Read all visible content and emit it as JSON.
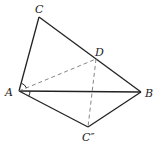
{
  "diagram": {
    "type": "geometry",
    "points": {
      "A": {
        "x": 19,
        "y": 91
      },
      "B": {
        "x": 141,
        "y": 92
      },
      "C": {
        "x": 39,
        "y": 17
      },
      "D": {
        "x": 96,
        "y": 59
      },
      "C2": {
        "x": 88,
        "y": 127
      }
    },
    "labels": {
      "A": "A",
      "B": "B",
      "C": "C",
      "D": "D",
      "C2": "C″"
    },
    "solid_segments": [
      "A-C",
      "C-B",
      "A-B",
      "A-C2",
      "C2-B"
    ],
    "dashed_segments": [
      "A-D",
      "D-C2"
    ],
    "angle_marks": [
      "CAD",
      "BAC2"
    ],
    "colors": {
      "line": "#222222",
      "dashed": "#777777",
      "background": "#ffffff"
    }
  }
}
